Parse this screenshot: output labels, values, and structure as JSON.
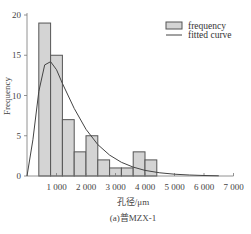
{
  "chart_data": {
    "type": "bar",
    "title": "(a)普MZX-1",
    "xlabel": "孔径/μm",
    "ylabel": "Frequency",
    "xlim": [
      0,
      7000
    ],
    "ylim": [
      0,
      20
    ],
    "x_ticks": [
      "1 000",
      "2 000",
      "3 000",
      "4 000",
      "5 000",
      "6 000",
      "7 000"
    ],
    "y_ticks": [
      "0",
      "5",
      "10",
      "15",
      "20"
    ],
    "bin_edges": [
      0,
      400,
      800,
      1200,
      1600,
      2000,
      2400,
      2800,
      3200,
      3600,
      4000,
      4400
    ],
    "categories": [
      "0-400",
      "400-800",
      "800-1200",
      "1200-1600",
      "1600-2000",
      "2000-2400",
      "2400-2800",
      "2800-3200",
      "3200-3600",
      "3600-4000",
      "4000-4400"
    ],
    "series": [
      {
        "name": "frequency",
        "values": [
          0,
          19,
          15,
          7,
          3,
          5,
          2,
          1,
          1,
          3,
          2
        ]
      },
      {
        "name": "fitted curve",
        "type": "line",
        "x": [
          0,
          200,
          400,
          600,
          800,
          1000,
          1200,
          1600,
          2000,
          2400,
          2800,
          3200,
          3600,
          4000,
          4500,
          5000,
          5500,
          6000,
          6500
        ],
        "values": [
          0,
          4.5,
          10.5,
          13.8,
          14.2,
          13.2,
          11.5,
          8.4,
          5.8,
          3.9,
          2.6,
          1.7,
          1.1,
          0.7,
          0.4,
          0.22,
          0.12,
          0.06,
          0.03
        ]
      }
    ],
    "legend": [
      "frequency",
      "fitted curve"
    ],
    "legend_position": "upper right",
    "grid": false
  },
  "legend": {
    "frequency": "frequency",
    "fitted": "fitted curve"
  },
  "axes": {
    "xlabel": "孔径/μm",
    "ylabel": "Frequency"
  },
  "caption": "(a)普MZX-1",
  "colors": {
    "bar_fill": "#d4d4d4",
    "bar_edge": "#555555",
    "curve": "#444444"
  }
}
